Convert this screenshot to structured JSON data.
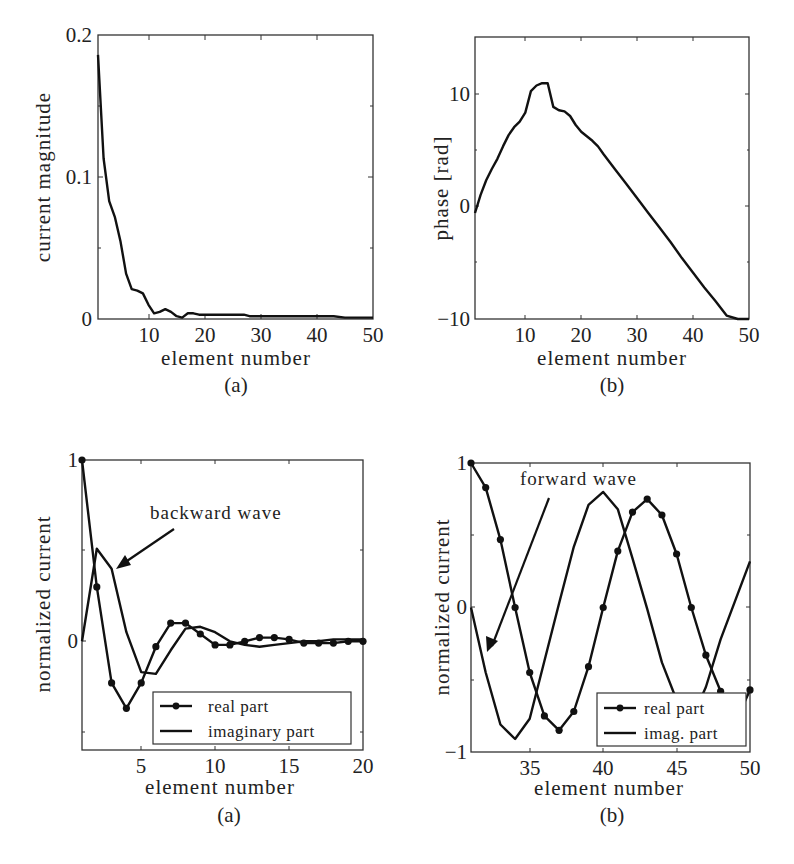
{
  "chart_data": [
    {
      "id": "top-a",
      "type": "line",
      "title": "",
      "caption": "(a)",
      "xlabel": "element number",
      "ylabel": "current magnitude",
      "xlim": [
        1,
        50
      ],
      "ylim": [
        0,
        0.2
      ],
      "xticks": [
        10,
        20,
        30,
        40,
        50
      ],
      "yticks": [
        0,
        0.1,
        0.2
      ],
      "ytick_labels": [
        "0",
        "0.1",
        "0.2"
      ],
      "grid": false,
      "series": [
        {
          "name": "current magnitude",
          "markers": false,
          "x": [
            1,
            2,
            3,
            4,
            5,
            6,
            7,
            8,
            9,
            10,
            11,
            12,
            13,
            14,
            15,
            16,
            17,
            18,
            19,
            20,
            22,
            24,
            26,
            27,
            28,
            30,
            35,
            40,
            42,
            43,
            45,
            48,
            50
          ],
          "y": [
            0.186,
            0.113,
            0.083,
            0.072,
            0.055,
            0.032,
            0.021,
            0.02,
            0.018,
            0.01,
            0.004,
            0.005,
            0.007,
            0.005,
            0.002,
            0.001,
            0.004,
            0.004,
            0.003,
            0.003,
            0.003,
            0.003,
            0.003,
            0.003,
            0.002,
            0.002,
            0.002,
            0.002,
            0.002,
            0.002,
            0.001,
            0.001,
            0.001
          ]
        }
      ]
    },
    {
      "id": "top-b",
      "type": "line",
      "title": "",
      "caption": "(b)",
      "xlabel": "element number",
      "ylabel": "phase  [rad]",
      "xlim": [
        1,
        50
      ],
      "ylim": [
        -10,
        15
      ],
      "xticks": [
        10,
        20,
        30,
        40,
        50
      ],
      "yticks": [
        -10,
        0,
        10
      ],
      "ytick_labels": [
        "-10",
        "0",
        "10"
      ],
      "grid": false,
      "series": [
        {
          "name": "phase",
          "markers": false,
          "x": [
            1,
            2,
            3,
            4,
            5,
            6,
            7,
            8,
            9,
            10,
            11,
            12,
            13,
            14,
            15,
            16,
            17,
            18,
            19,
            20,
            21,
            22,
            23,
            24,
            26,
            28,
            30,
            32,
            34,
            36,
            38,
            40,
            42,
            44,
            46,
            48,
            50
          ],
          "y": [
            -0.6,
            1.0,
            2.3,
            3.3,
            4.2,
            5.3,
            6.3,
            7.0,
            7.5,
            8.3,
            10.2,
            10.7,
            10.9,
            10.9,
            8.8,
            8.5,
            8.4,
            8.0,
            7.2,
            6.6,
            6.2,
            5.8,
            5.3,
            4.6,
            3.3,
            2.0,
            0.7,
            -0.6,
            -1.9,
            -3.2,
            -4.6,
            -5.9,
            -7.2,
            -8.4,
            -9.7,
            -10.9,
            -12.2
          ]
        }
      ]
    },
    {
      "id": "bottom-a",
      "type": "line",
      "title": "",
      "caption": "(a)",
      "xlabel": "element number",
      "ylabel": "normalized current",
      "xlim": [
        1,
        20
      ],
      "ylim": [
        -0.6,
        1
      ],
      "xticks": [
        5,
        10,
        15,
        20
      ],
      "yticks": [
        0,
        1
      ],
      "ytick_labels": [
        "0",
        "1"
      ],
      "grid": false,
      "annotation": {
        "text": "backward wave",
        "arrow_to": [
          3.2,
          0.4
        ]
      },
      "legend": {
        "position": "lower right",
        "entries": [
          "real part",
          "imaginary part"
        ]
      },
      "series": [
        {
          "name": "real part",
          "markers": true,
          "x": [
            1,
            2,
            3,
            4,
            5,
            6,
            7,
            8,
            9,
            10,
            11,
            12,
            13,
            14,
            15,
            16,
            17,
            18,
            19,
            20
          ],
          "y": [
            1.0,
            0.3,
            -0.23,
            -0.37,
            -0.23,
            -0.03,
            0.1,
            0.1,
            0.04,
            -0.02,
            -0.02,
            0.0,
            0.02,
            0.02,
            0.01,
            -0.01,
            -0.01,
            -0.01,
            0.0,
            0.0
          ]
        },
        {
          "name": "imaginary part",
          "markers": false,
          "x": [
            1,
            2,
            3,
            4,
            5,
            6,
            7,
            8,
            9,
            10,
            11,
            12,
            13,
            14,
            15,
            16,
            17,
            18,
            19,
            20
          ],
          "y": [
            0.0,
            0.51,
            0.4,
            0.05,
            -0.17,
            -0.18,
            -0.05,
            0.07,
            0.08,
            0.05,
            0.0,
            -0.02,
            -0.03,
            -0.02,
            -0.01,
            0.0,
            0.0,
            0.01,
            0.01,
            0.01
          ]
        }
      ]
    },
    {
      "id": "bottom-b",
      "type": "line",
      "title": "",
      "caption": "(b)",
      "xlabel": "element number",
      "ylabel": "normalized current",
      "xlim": [
        31,
        50
      ],
      "ylim": [
        -1,
        1
      ],
      "xticks": [
        35,
        40,
        45,
        50
      ],
      "yticks": [
        -1,
        0,
        1
      ],
      "ytick_labels": [
        "-1",
        "0",
        "1"
      ],
      "grid": false,
      "annotation": {
        "text": "forward wave",
        "arrow_to": [
          32.2,
          -0.3
        ]
      },
      "legend": {
        "position": "lower right",
        "entries": [
          "real part",
          "imag. part"
        ]
      },
      "series": [
        {
          "name": "real part",
          "markers": true,
          "x": [
            31,
            32,
            33,
            34,
            35,
            36,
            37,
            38,
            39,
            40,
            41,
            42,
            43,
            44,
            45,
            46,
            47,
            48,
            49,
            50
          ],
          "y": [
            1.0,
            0.83,
            0.47,
            0.0,
            -0.45,
            -0.75,
            -0.85,
            -0.72,
            -0.41,
            0.0,
            0.39,
            0.66,
            0.75,
            0.64,
            0.37,
            0.0,
            -0.33,
            -0.58,
            -0.8,
            -0.57
          ]
        },
        {
          "name": "imag. part",
          "markers": false,
          "x": [
            31,
            32,
            33,
            34,
            35,
            36,
            37,
            38,
            39,
            40,
            41,
            42,
            43,
            44,
            45,
            46,
            47,
            48,
            49,
            50
          ],
          "y": [
            0.0,
            -0.45,
            -0.81,
            -0.91,
            -0.77,
            -0.37,
            0.03,
            0.42,
            0.71,
            0.8,
            0.68,
            0.34,
            -0.01,
            -0.38,
            -0.64,
            -0.78,
            -0.55,
            -0.22,
            0.05,
            0.32
          ]
        }
      ]
    }
  ],
  "figure": {
    "top_a": {
      "caption": "(a)",
      "xlabel": "element number",
      "ylabel": "current magnitude",
      "yticks": [
        "0",
        "0.1",
        "0.2"
      ],
      "xticks": [
        "10",
        "20",
        "30",
        "40",
        "50"
      ]
    },
    "top_b": {
      "caption": "(b)",
      "xlabel": "element number",
      "ylabel": "phase  [rad]",
      "yticks": [
        "−10",
        "0",
        "10"
      ],
      "xticks": [
        "10",
        "20",
        "30",
        "40",
        "50"
      ]
    },
    "bottom_a": {
      "caption": "(a)",
      "xlabel": "element number",
      "ylabel": "normalized current",
      "yticks": [
        "0",
        "1"
      ],
      "xticks": [
        "5",
        "10",
        "15",
        "20"
      ],
      "annotation": "backward wave",
      "legend": [
        "real part",
        "imaginary part"
      ]
    },
    "bottom_b": {
      "caption": "(b)",
      "xlabel": "element number",
      "ylabel": "normalized current",
      "yticks": [
        "−1",
        "0",
        "1"
      ],
      "xticks": [
        "35",
        "40",
        "45",
        "50"
      ],
      "annotation": "forward wave",
      "legend": [
        "real part",
        "imag. part"
      ]
    }
  }
}
